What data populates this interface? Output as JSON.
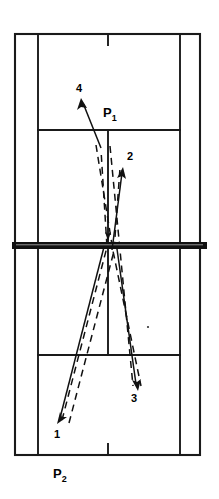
{
  "figure": {
    "background_color": "#ffffff",
    "line_color": "#1a1a1a",
    "net_color": "#111111",
    "shot_color": "#111111"
  },
  "court": {
    "outer_left": 15,
    "outer_right": 200,
    "outer_top": 34,
    "outer_bottom": 455,
    "singles_sideline_left": 38,
    "singles_sideline_right": 180,
    "centre_line_x": 108,
    "top_service_line_y": 130,
    "bottom_service_line_y": 355,
    "net_y": 245,
    "net_left": 12,
    "net_right": 207,
    "net_thickness": 6,
    "centre_mark_top": {
      "x": 108,
      "y1": 34,
      "y2": 45
    },
    "centre_mark_bottom": {
      "x": 108,
      "y1": 444,
      "y2": 455
    }
  },
  "players": [
    {
      "id": "P1",
      "letter": "P",
      "subscript": "1",
      "x": 103,
      "y": 117
    },
    {
      "id": "P2",
      "letter": "P",
      "subscript": "2",
      "x": 53,
      "y": 478
    }
  ],
  "shots": [
    {
      "number": "1",
      "label_x": 54,
      "label_y": 438,
      "from": {
        "x": 104,
        "y": 247
      },
      "to": {
        "x": 58,
        "y": 422
      },
      "direction": "down-left",
      "description": "Shot 1 travels from the net area down to the left rear court"
    },
    {
      "number": "2",
      "label_x": 127,
      "label_y": 160,
      "from": {
        "x": 112,
        "y": 250
      },
      "to": {
        "x": 123,
        "y": 170
      },
      "direction": "up-right",
      "description": "Shot 2 travels from near the net up to the right forecourt"
    },
    {
      "number": "3",
      "label_x": 131,
      "label_y": 402,
      "from": {
        "x": 117,
        "y": 249
      },
      "to": {
        "x": 138,
        "y": 389
      },
      "direction": "down-right",
      "description": "Shot 3 travels from the net down to the right rear court"
    },
    {
      "number": "4",
      "label_x": 76,
      "label_y": 92,
      "from": {
        "x": 101,
        "y": 148
      },
      "to": {
        "x": 82,
        "y": 101
      },
      "direction": "up-left",
      "description": "Shot 4 travels from the mid court up to the left forecourt"
    }
  ],
  "trajectories": [
    {
      "name": "rally-path-a",
      "points": "62,420 107,247 101,150",
      "style": "dashed"
    },
    {
      "name": "rally-path-b",
      "points": "69,423 114,251 120,168",
      "style": "dashed"
    },
    {
      "name": "rally-path-c",
      "points": "96,145 113,251 141,386",
      "style": "dashed"
    },
    {
      "name": "rally-path-d",
      "points": "110,146 120,250 133,386",
      "style": "dashed"
    }
  ],
  "annotations": {
    "speck": {
      "x": 148,
      "y": 327,
      "r": 1.1
    }
  }
}
